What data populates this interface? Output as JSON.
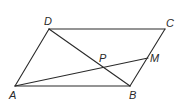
{
  "diagram": {
    "type": "geometry",
    "points": {
      "A": {
        "label": "A",
        "x": 15,
        "y": 86,
        "lx": 9,
        "ly": 99
      },
      "B": {
        "label": "B",
        "x": 130,
        "y": 86,
        "lx": 129,
        "ly": 99
      },
      "C": {
        "label": "C",
        "x": 165,
        "y": 29,
        "lx": 166,
        "ly": 27
      },
      "D": {
        "label": "D",
        "x": 49,
        "y": 29,
        "lx": 44,
        "ly": 25
      },
      "M": {
        "label": "M",
        "x": 148,
        "y": 58,
        "lx": 150,
        "ly": 62
      },
      "P": {
        "label": "P",
        "x": 104,
        "y": 67,
        "lx": 99,
        "ly": 62
      }
    },
    "segments": [
      {
        "name": "AB",
        "from": "A",
        "to": "B"
      },
      {
        "name": "BC",
        "from": "B",
        "to": "C"
      },
      {
        "name": "CD",
        "from": "C",
        "to": "D"
      },
      {
        "name": "DA",
        "from": "D",
        "to": "A"
      },
      {
        "name": "DB",
        "from": "D",
        "to": "B"
      },
      {
        "name": "AM",
        "from": "A",
        "to": "M"
      }
    ],
    "colors": {
      "line": "#2a2a2a",
      "background": "#ffffff"
    }
  }
}
